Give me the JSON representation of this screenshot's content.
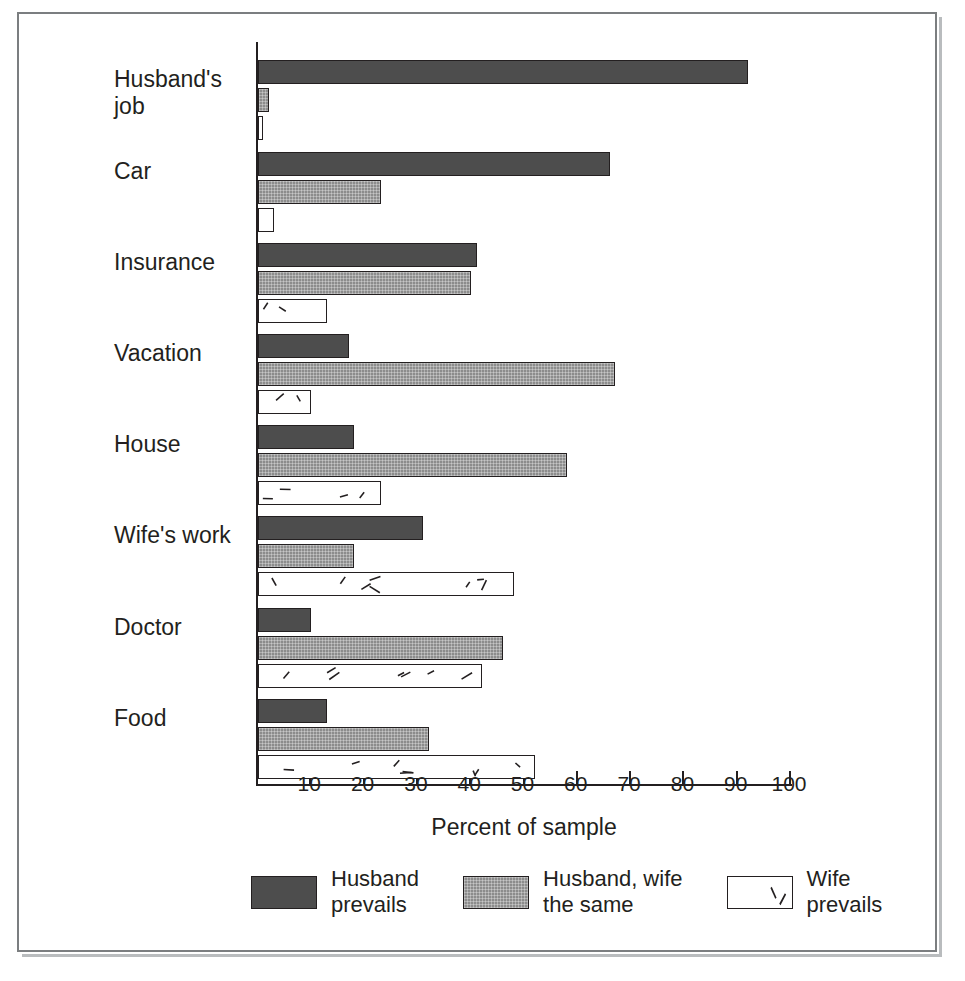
{
  "chart_data": {
    "type": "bar",
    "orientation": "horizontal",
    "title": "",
    "xlabel": "Percent of sample",
    "ylabel": "",
    "xlim": [
      0,
      100
    ],
    "xticks": [
      10,
      20,
      30,
      40,
      50,
      60,
      70,
      80,
      90,
      100
    ],
    "grid": false,
    "legend_position": "bottom",
    "categories": [
      "Husband's\njob",
      "Car",
      "Insurance",
      "Vacation",
      "House",
      "Wife's work",
      "Doctor",
      "Food"
    ],
    "series": [
      {
        "name": "Husband\nprevails",
        "color": "#4d4d4d",
        "pattern": "solid-dark",
        "values": [
          92,
          66,
          41,
          17,
          18,
          31,
          10,
          13
        ]
      },
      {
        "name": "Husband, wife\nthe same",
        "color": "#8c8c8c",
        "pattern": "stipple-gray",
        "values": [
          2,
          23,
          40,
          67,
          58,
          18,
          46,
          32
        ]
      },
      {
        "name": "Wife\nprevails",
        "color": "#ffffff",
        "pattern": "white-with-dashes",
        "values": [
          1,
          3,
          13,
          10,
          23,
          48,
          42,
          52
        ]
      }
    ]
  },
  "axis": {
    "xlabel": "Percent of sample",
    "tick_labels": [
      "10",
      "20",
      "30",
      "40",
      "50",
      "60",
      "70",
      "80",
      "90",
      "100"
    ]
  },
  "legend": {
    "items": [
      {
        "label": "Husband\nprevails",
        "swatch": "dark-gray-swatch"
      },
      {
        "label": "Husband, wife\nthe same",
        "swatch": "medium-gray-swatch"
      },
      {
        "label": "Wife\nprevails",
        "swatch": "white-dash-swatch"
      }
    ]
  },
  "colors": {
    "series_dark": "#4d4d4d",
    "series_medium": "#8c8c8c",
    "series_light": "#ffffff",
    "ink": "#231f20",
    "frame": "#7b7e80"
  }
}
